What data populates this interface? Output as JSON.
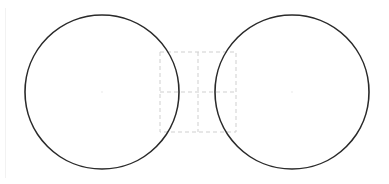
{
  "diagram": {
    "colors": {
      "background": "#ffffff",
      "circle_stroke": "#2a2a2a",
      "guide_stroke": "#cfcfcf",
      "center_dot": "#e6e6e6"
    },
    "circles": [
      {
        "name": "left-circle",
        "cx": 102,
        "cy": 92,
        "r": 77
      },
      {
        "name": "right-circle",
        "cx": 292,
        "cy": 92,
        "r": 77
      }
    ],
    "guide_box": {
      "x": 160,
      "y": 52,
      "width": 76,
      "height": 80,
      "mid_x": 198,
      "mid_y": 92
    }
  }
}
